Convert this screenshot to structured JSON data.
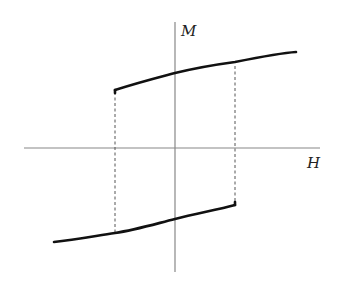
{
  "diagram": {
    "axes": {
      "x_label": "H",
      "y_label": "M"
    },
    "colors": {
      "background": "#ffffff",
      "axis": "#888888",
      "curve": "#111111",
      "dashed": "#555555"
    },
    "branches": [
      {
        "name": "upper-branch",
        "points": [
          [
            115,
            90
          ],
          [
            175,
            73
          ],
          [
            235,
            64
          ],
          [
            296,
            52
          ]
        ]
      },
      {
        "name": "lower-branch",
        "points": [
          [
            54,
            242
          ],
          [
            115,
            233
          ],
          [
            175,
            219
          ],
          [
            235,
            205
          ]
        ]
      }
    ],
    "transitions": [
      {
        "name": "left-switch-dashed",
        "x": 115,
        "y_top": 90,
        "y_bottom": 233
      },
      {
        "name": "right-switch-dashed",
        "x": 235,
        "y_top": 64,
        "y_bottom": 205
      }
    ]
  }
}
